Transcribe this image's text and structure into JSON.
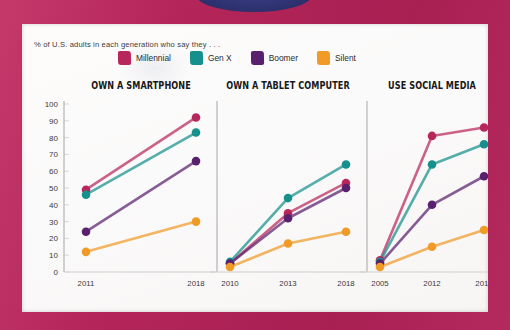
{
  "poster": {
    "border_color": "#b4265a",
    "sheet_color": "#fbfafa",
    "top_ellipse_color": "#2e3270"
  },
  "subtitle": "% of U.S. adults in each generation who say they . . .",
  "legend": {
    "items": [
      {
        "label": "Millennial",
        "color": "#b8275c",
        "swatch_icon": "color-swatch-icon"
      },
      {
        "label": "Gen X",
        "color": "#15908c",
        "swatch_icon": "color-swatch-icon"
      },
      {
        "label": "Boomer",
        "color": "#59206e",
        "swatch_icon": "color-swatch-icon"
      },
      {
        "label": "Silent",
        "color": "#f09a28",
        "swatch_icon": "color-swatch-icon"
      }
    ]
  },
  "y_axis": {
    "label": "",
    "ticks": [
      0,
      10,
      20,
      30,
      40,
      50,
      60,
      70,
      80,
      90,
      100
    ],
    "min": 0,
    "max": 100
  },
  "chart_data": [
    {
      "type": "line",
      "title": "OWN A SMARTPHONE",
      "xlabel": "",
      "ylabel": "",
      "grid": false,
      "legend_position": "top",
      "categories": [
        "2011",
        "2018"
      ],
      "x": [
        2011,
        2018
      ],
      "ylim": [
        0,
        100
      ],
      "series": [
        {
          "name": "Millennial",
          "color": "#b8275c",
          "values": [
            49,
            92
          ]
        },
        {
          "name": "Gen X",
          "color": "#15908c",
          "values": [
            46,
            83
          ]
        },
        {
          "name": "Boomer",
          "color": "#59206e",
          "values": [
            24,
            66
          ]
        },
        {
          "name": "Silent",
          "color": "#f09a28",
          "values": [
            12,
            30
          ]
        }
      ]
    },
    {
      "type": "line",
      "title": "OWN A TABLET COMPUTER",
      "xlabel": "",
      "ylabel": "",
      "grid": false,
      "legend_position": "top",
      "categories": [
        "2010",
        "2013",
        "2018"
      ],
      "x": [
        2010,
        2013,
        2018
      ],
      "ylim": [
        0,
        100
      ],
      "series": [
        {
          "name": "Millennial",
          "color": "#b8275c",
          "values": [
            5,
            35,
            53
          ]
        },
        {
          "name": "Gen X",
          "color": "#15908c",
          "values": [
            6,
            44,
            64
          ]
        },
        {
          "name": "Boomer",
          "color": "#59206e",
          "values": [
            5,
            32,
            50
          ]
        },
        {
          "name": "Silent",
          "color": "#f09a28",
          "values": [
            3,
            17,
            24
          ]
        }
      ]
    },
    {
      "type": "line",
      "title": "USE SOCIAL MEDIA",
      "xlabel": "",
      "ylabel": "",
      "grid": false,
      "legend_position": "top",
      "categories": [
        "2005",
        "2012",
        "2018"
      ],
      "x": [
        2005,
        2012,
        2018
      ],
      "ylim": [
        0,
        100
      ],
      "series": [
        {
          "name": "Millennial",
          "color": "#b8275c",
          "values": [
            7,
            81,
            86
          ]
        },
        {
          "name": "Gen X",
          "color": "#15908c",
          "values": [
            6,
            64,
            76
          ]
        },
        {
          "name": "Boomer",
          "color": "#59206e",
          "values": [
            5,
            40,
            57
          ]
        },
        {
          "name": "Silent",
          "color": "#f09a28",
          "values": [
            3,
            15,
            25
          ]
        }
      ]
    }
  ]
}
